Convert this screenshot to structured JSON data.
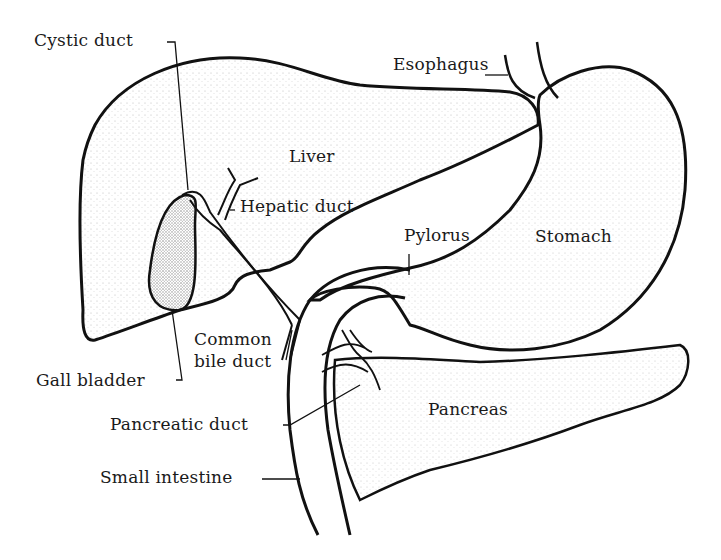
{
  "diagram": {
    "type": "anatomical-illustration",
    "ink_color": "#111111",
    "background": "#ffffff",
    "labels": {
      "cystic_duct": "Cystic duct",
      "esophagus": "Esophagus",
      "liver": "Liver",
      "hepatic_duct": "Hepatic duct",
      "pylorus": "Pylorus",
      "stomach": "Stomach",
      "common_bile_duct_line1": "Common",
      "common_bile_duct_line2": "bile duct",
      "gall_bladder": "Gall bladder",
      "pancreatic_duct": "Pancreatic duct",
      "pancreas": "Pancreas",
      "small_intestine": "Small intestine"
    }
  }
}
